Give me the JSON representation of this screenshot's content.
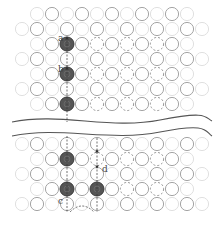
{
  "colors": {
    "background": "#ffffff",
    "ring_strong": "#9a9a9a",
    "ring_faint": "#dcdcdc",
    "vacancy": "#8a8a8a",
    "atom_fill": "#555555",
    "atom_stroke": "#3a3a3a",
    "break_line": "#555555",
    "arrow": "#333333"
  },
  "grid": {
    "x0": 22,
    "dx": 15,
    "r": 6.6
  },
  "panels": {
    "top": {
      "rows": [
        {
          "y": 14,
          "cols": [
            1,
            2,
            3,
            4,
            5,
            6,
            7,
            8,
            9,
            10,
            11
          ],
          "strong": [
            2,
            4,
            6,
            8,
            10
          ]
        },
        {
          "y": 29,
          "cols": [
            0,
            1,
            2,
            3,
            4,
            5,
            6,
            7,
            8,
            9,
            10,
            11,
            12
          ],
          "strong": [
            1,
            3,
            5,
            7,
            9,
            11
          ]
        },
        {
          "y": 44,
          "cols": [
            1,
            2,
            3,
            4,
            5,
            6,
            7,
            8,
            9,
            10,
            11
          ],
          "strong": [
            2,
            4,
            6,
            8,
            10
          ],
          "vacancies": [
            5,
            7,
            9
          ],
          "atoms": [
            3
          ]
        },
        {
          "y": 59,
          "cols": [
            0,
            1,
            2,
            3,
            4,
            5,
            6,
            7,
            8,
            9,
            10,
            11,
            12
          ],
          "strong": [
            1,
            3,
            5,
            7,
            9,
            11
          ]
        },
        {
          "y": 74,
          "cols": [
            1,
            2,
            3,
            4,
            5,
            6,
            7,
            8,
            9,
            10,
            11
          ],
          "strong": [
            2,
            4,
            6,
            8,
            10
          ],
          "vacancies": [
            5,
            7,
            9
          ],
          "atoms": [
            3
          ]
        },
        {
          "y": 89,
          "cols": [
            0,
            1,
            2,
            3,
            4,
            5,
            6,
            7,
            8,
            9,
            10,
            11,
            12
          ],
          "strong": [
            1,
            3,
            5,
            7,
            9,
            11
          ]
        },
        {
          "y": 104,
          "cols": [
            1,
            2,
            3,
            4,
            5,
            6,
            7,
            8,
            9,
            10,
            11
          ],
          "strong": [
            2,
            4,
            6,
            8,
            10
          ],
          "vacancies": [
            5,
            7,
            9
          ],
          "atoms": [
            3
          ]
        }
      ]
    },
    "bottom": {
      "rows": [
        {
          "y": 144,
          "cols": [
            0,
            1,
            2,
            3,
            4,
            5,
            6,
            7,
            8,
            9,
            10,
            11,
            12
          ],
          "strong": [
            1,
            3,
            5,
            7,
            9,
            11
          ]
        },
        {
          "y": 159,
          "cols": [
            1,
            2,
            3,
            4,
            5,
            6,
            7,
            8,
            9,
            10,
            11
          ],
          "strong": [
            2,
            4,
            6,
            8,
            10
          ],
          "vacancies": [
            5,
            7,
            9
          ],
          "atoms": [
            3
          ]
        },
        {
          "y": 174,
          "cols": [
            0,
            1,
            2,
            3,
            4,
            5,
            6,
            7,
            8,
            9,
            10,
            11,
            12
          ],
          "strong": [
            1,
            3,
            5,
            7,
            9,
            11
          ]
        },
        {
          "y": 189,
          "cols": [
            1,
            2,
            3,
            4,
            5,
            6,
            7,
            8,
            9,
            10,
            11
          ],
          "strong": [
            2,
            4,
            6,
            8,
            10
          ],
          "vacancies": [
            7,
            9
          ],
          "atoms": [
            3,
            5
          ]
        },
        {
          "y": 204,
          "cols": [
            0,
            1,
            2,
            3,
            4,
            5,
            6,
            7,
            8,
            9,
            10,
            11,
            12
          ],
          "strong": [
            1,
            3,
            5,
            7,
            9,
            11
          ]
        }
      ]
    }
  },
  "labels": [
    {
      "id": "a",
      "text": "a",
      "x": 58,
      "y": 41
    },
    {
      "id": "b",
      "text": "b",
      "x": 58,
      "y": 72
    },
    {
      "id": "c",
      "text": "c",
      "x": 58,
      "y": 204
    },
    {
      "id": "d",
      "text": "d",
      "x": 102,
      "y": 172
    }
  ],
  "break_lines": [
    {
      "d": "M12,122 C60,112 110,130 160,120 S205,118 212,121"
    },
    {
      "d": "M12,136 C60,126 110,142 160,132 S205,132 212,136"
    }
  ]
}
